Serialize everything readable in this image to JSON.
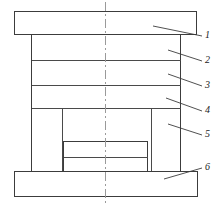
{
  "drawing": {
    "type": "engineering-cross-section",
    "title": "Die assembly cross-section",
    "canvas": {
      "width": 221,
      "height": 207
    },
    "centerline": {
      "x": 105,
      "y_top": 2,
      "y_bottom": 205,
      "style": "dash-dot"
    },
    "components": [
      {
        "id": 1,
        "name": "top-plate",
        "label": "1",
        "shape": "rect",
        "x": 14,
        "y": 11,
        "width": 183,
        "height": 24
      },
      {
        "id": 2,
        "name": "upper-body-section",
        "label": "2",
        "shape": "rect",
        "x": 31,
        "y": 35,
        "width": 150,
        "height": 25
      },
      {
        "id": 3,
        "name": "middle-body-section",
        "label": "3",
        "shape": "rect",
        "x": 31,
        "y": 60,
        "width": 150,
        "height": 25
      },
      {
        "id": 4,
        "name": "lower-body-section",
        "label": "4",
        "shape": "rect",
        "x": 31,
        "y": 85,
        "width": 150,
        "height": 23
      },
      {
        "id": 5,
        "name": "side-column",
        "label": "5",
        "shape": "rect",
        "x": 152,
        "y": 108,
        "width": 29,
        "height": 64
      },
      {
        "id": 6,
        "name": "base-plate",
        "label": "6",
        "shape": "rect",
        "x": 14,
        "y": 172,
        "width": 184,
        "height": 25
      }
    ],
    "inner_block": {
      "name": "center-insert",
      "x": 63,
      "y": 141,
      "width": 85,
      "height": 31,
      "split_line_y": 157
    },
    "cavity": {
      "name": "inner-cavity",
      "left_wall_x": 62,
      "right_wall_x": 152,
      "top_y": 108,
      "bottom_y": 172
    },
    "columns": {
      "left_outer_x": 31,
      "right_outer_x": 181,
      "left_inner_x": 62,
      "right_inner_x": 152,
      "top_y": 35,
      "bottom_y": 172
    },
    "dividers": [
      {
        "name": "divider-1",
        "y": 60,
        "x1": 31,
        "x2": 181
      },
      {
        "name": "divider-2",
        "y": 85,
        "x1": 31,
        "x2": 181
      },
      {
        "name": "divider-3",
        "y": 108,
        "x1": 31,
        "x2": 181
      }
    ],
    "callouts": [
      {
        "label": "1",
        "text_x": 205,
        "text_y": 33,
        "leader": {
          "x1": 153,
          "y1": 26,
          "x2": 202,
          "y2": 36
        }
      },
      {
        "label": "2",
        "text_x": 205,
        "text_y": 58,
        "leader": {
          "x1": 168,
          "y1": 50,
          "x2": 202,
          "y2": 61
        }
      },
      {
        "label": "3",
        "text_x": 205,
        "text_y": 83,
        "leader": {
          "x1": 168,
          "y1": 74,
          "x2": 202,
          "y2": 86
        }
      },
      {
        "label": "4",
        "text_x": 205,
        "text_y": 108,
        "leader": {
          "x1": 166,
          "y1": 98,
          "x2": 202,
          "y2": 111
        }
      },
      {
        "label": "5",
        "text_x": 205,
        "text_y": 132,
        "leader": {
          "x1": 168,
          "y1": 124,
          "x2": 202,
          "y2": 135
        }
      },
      {
        "label": "6",
        "text_x": 205,
        "text_y": 169,
        "leader": {
          "x1": 164,
          "y1": 179,
          "x2": 202,
          "y2": 168
        }
      }
    ],
    "colors": {
      "stroke": "#3c3c3c",
      "divider": "#4a4a4a",
      "centerline": "#9a9a9a",
      "label_text": "#1a1a1a",
      "background": "#ffffff"
    }
  }
}
